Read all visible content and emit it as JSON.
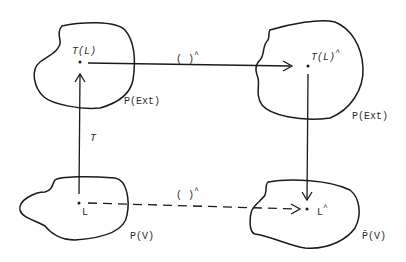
{
  "diagram": {
    "type": "commutative-diagram",
    "line_color": "#1a1a1a",
    "nodes": {
      "top_left": {
        "point_label": "T(L)",
        "region_label": "P(Ext)"
      },
      "top_right": {
        "point_label": "T(L)",
        "point_superscript": "^",
        "region_label": "P(Ext)"
      },
      "bottom_left": {
        "point_label": "L",
        "region_label": "P(V)"
      },
      "bottom_right": {
        "point_label": "L",
        "point_superscript": "^",
        "region_label": "P̄(V)"
      }
    },
    "edges": {
      "top": {
        "label": "( )",
        "superscript": "^",
        "style": "solid",
        "from": "top_left",
        "to": "top_right"
      },
      "bottom": {
        "label": "( )",
        "superscript": "^",
        "style": "dashed",
        "from": "bottom_left",
        "to": "bottom_right"
      },
      "left": {
        "label": "T",
        "style": "solid",
        "from": "bottom_left",
        "to": "top_left"
      },
      "right": {
        "label": "",
        "style": "solid",
        "from": "top_right",
        "to": "bottom_right"
      }
    }
  }
}
